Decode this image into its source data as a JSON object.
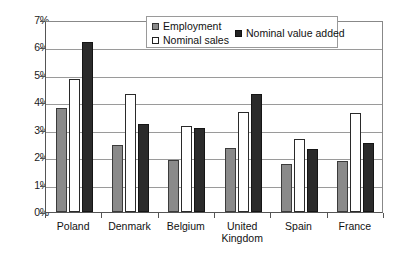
{
  "chart_data": {
    "type": "bar",
    "title": "",
    "xlabel": "",
    "ylabel": "",
    "ylim": [
      0,
      7
    ],
    "ytick_labels": [
      "0%",
      "1%",
      "2%",
      "3%",
      "4%",
      "5%",
      "6%",
      "7%"
    ],
    "ytick_values": [
      0,
      1,
      2,
      3,
      4,
      5,
      6,
      7
    ],
    "grid": true,
    "legend_position": "top-center",
    "categories": [
      "Poland",
      "Denmark",
      "Belgium",
      "United\nKingdom",
      "Spain",
      "France"
    ],
    "series": [
      {
        "name": "Employment",
        "color": "#8a8a8a",
        "values": [
          3.8,
          2.45,
          1.9,
          2.35,
          1.75,
          1.85
        ]
      },
      {
        "name": "Nominal sales",
        "color": "#ffffff",
        "values": [
          4.85,
          4.3,
          3.15,
          3.65,
          2.65,
          3.6
        ]
      },
      {
        "name": "Nominal value added",
        "color": "#2b2b2b",
        "values": [
          6.2,
          3.2,
          3.05,
          4.3,
          2.3,
          2.5
        ]
      }
    ]
  },
  "legend": {
    "employment": "Employment",
    "nominal_sales": "Nominal sales",
    "nominal_value_added": "Nominal value added"
  }
}
